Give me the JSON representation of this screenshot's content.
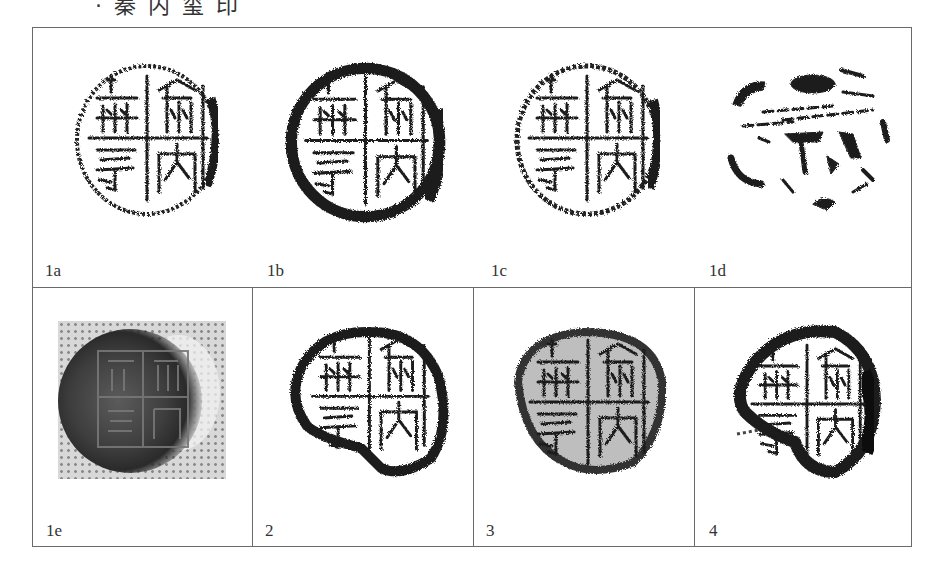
{
  "caption": {
    "text": "·秦内玺印"
  },
  "figure": {
    "top_row": {
      "panels": [
        {
          "id": "1a",
          "label": "1a",
          "type": "rubbing",
          "state": "clear"
        },
        {
          "id": "1b",
          "label": "1b",
          "type": "rubbing",
          "state": "heavy"
        },
        {
          "id": "1c",
          "label": "1c",
          "type": "rubbing",
          "state": "clear"
        },
        {
          "id": "1d",
          "label": "1d",
          "type": "rubbing",
          "state": "fragmentary"
        }
      ]
    },
    "bottom_row": {
      "panels": [
        {
          "id": "1e",
          "label": "1e",
          "type": "photograph"
        },
        {
          "id": "2",
          "label": "2",
          "type": "rubbing",
          "state": "partial"
        },
        {
          "id": "3",
          "label": "3",
          "type": "rubbing",
          "state": "dense"
        },
        {
          "id": "4",
          "label": "4",
          "type": "rubbing",
          "state": "partial"
        }
      ]
    },
    "colors": {
      "border": "#6a6a6a",
      "ink": "#1c1c1c",
      "paper": "#ffffff",
      "photo_bg": "#d8d8d8"
    }
  }
}
